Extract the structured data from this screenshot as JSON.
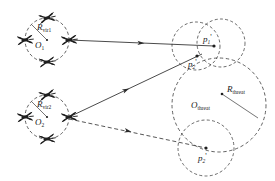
{
  "figure": {
    "type": "schematic-diagram",
    "background_color": "#ffffff",
    "line_color": "#2b2b2b"
  },
  "labels": {
    "r_vir1": {
      "base": "R",
      "sub": "vir1"
    },
    "r_vir2": {
      "base": "R",
      "sub": "vir2"
    },
    "o1": {
      "base": "O",
      "sub": "1"
    },
    "o2": {
      "base": "O",
      "sub": "2"
    },
    "r_threat": {
      "base": "R",
      "sub": "threat"
    },
    "o_threat": {
      "base": "O",
      "sub": "threat"
    },
    "p1_prime": {
      "base": "p",
      "sub": "1",
      "prime": "'"
    },
    "p2_prime": {
      "base": "p",
      "sub": "2",
      "prime": "'"
    },
    "p2_prime_lower": {
      "base": "p",
      "sub": "2",
      "prime": "'"
    }
  },
  "shapes": {
    "virtual_circle_1": {
      "cx": 47,
      "cy": 40,
      "r": 22,
      "style": "dashed",
      "label": "R_vir1",
      "center_label": "O_1"
    },
    "virtual_circle_2": {
      "cx": 47,
      "cy": 117,
      "r": 22,
      "style": "dashed",
      "label": "R_vir2",
      "center_label": "O_2"
    },
    "threat_circle": {
      "cx": 219,
      "cy": 105,
      "r": 47,
      "style": "dashed",
      "label": "R_threat",
      "center_label": "O_threat"
    },
    "small_circle_upper_left": {
      "cx": 196,
      "cy": 46,
      "r": 24,
      "style": "dashed"
    },
    "small_circle_upper_right": {
      "cx": 221,
      "cy": 43,
      "r": 24,
      "style": "dashed"
    },
    "small_circle_lower": {
      "cx": 206,
      "cy": 148,
      "r": 28,
      "style": "dashed"
    }
  },
  "points": [
    {
      "name": "p1_prime",
      "x": 213,
      "y": 45,
      "label": "p1'"
    },
    {
      "name": "p2_prime_upper",
      "x": 196,
      "y": 56,
      "label": "p2'"
    },
    {
      "name": "p2_prime_lower",
      "x": 206,
      "y": 148,
      "label": "p2'"
    },
    {
      "name": "o_threat_center",
      "x": 222,
      "y": 94,
      "label": "O_threat"
    }
  ],
  "arrows": [
    {
      "name": "arrow-o1-to-p1",
      "style": "solid",
      "from": [
        69,
        40
      ],
      "to": [
        213,
        45
      ],
      "arrowhead_mid": true
    },
    {
      "name": "arrow-o2-to-p2-upper",
      "style": "solid",
      "from": [
        69,
        117
      ],
      "to": [
        201,
        54
      ],
      "arrowhead_mid": true
    },
    {
      "name": "arrow-o2-to-p2-lower",
      "style": "dashed",
      "from": [
        69,
        120
      ],
      "to": [
        206,
        148
      ],
      "arrowhead_mid": true
    }
  ],
  "uavs": [
    {
      "name": "uav-circle1-north",
      "x": 47,
      "y": 18
    },
    {
      "name": "uav-circle1-south",
      "x": 47,
      "y": 62
    },
    {
      "name": "uav-circle1-west",
      "x": 25,
      "y": 40
    },
    {
      "name": "uav-circle1-east",
      "x": 69,
      "y": 40
    },
    {
      "name": "uav-circle2-north",
      "x": 47,
      "y": 95
    },
    {
      "name": "uav-circle2-south",
      "x": 47,
      "y": 139
    },
    {
      "name": "uav-circle2-west",
      "x": 25,
      "y": 117
    },
    {
      "name": "uav-circle2-east",
      "x": 69,
      "y": 117
    }
  ]
}
